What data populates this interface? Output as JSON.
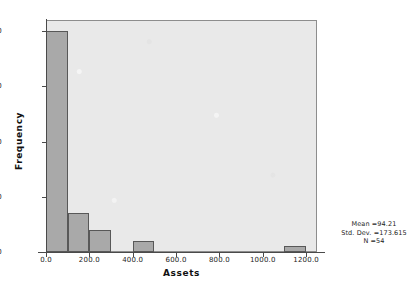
{
  "chart_data": {
    "type": "bar",
    "subtype": "histogram",
    "title": "",
    "xlabel": "Assets",
    "ylabel": "Frequency",
    "xlim": [
      0,
      1250
    ],
    "ylim": [
      0,
      42
    ],
    "xticks": [
      "0.0",
      "200.0",
      "400.0",
      "600.0",
      "800.0",
      "1000.0",
      "1200.0"
    ],
    "xtick_values": [
      0,
      200,
      400,
      600,
      800,
      1000,
      1200
    ],
    "yticks": [
      "0",
      "10",
      "20",
      "30",
      "40"
    ],
    "ytick_values": [
      0,
      10,
      20,
      30,
      40
    ],
    "grid": false,
    "legend": "none",
    "bin_width": 100,
    "bins": [
      {
        "x0": 0,
        "x1": 100,
        "value": 40
      },
      {
        "x0": 100,
        "x1": 200,
        "value": 7
      },
      {
        "x0": 200,
        "x1": 300,
        "value": 4
      },
      {
        "x0": 400,
        "x1": 500,
        "value": 2
      },
      {
        "x0": 1100,
        "x1": 1200,
        "value": 1
      }
    ],
    "annotations": {
      "mean": "Mean =94.21",
      "std_dev": "Std. Dev. =173.615",
      "n": "N =54"
    },
    "colors": {
      "bar_fill": "#a9a9a9",
      "bar_border": "#585858",
      "plot_background": "#e9e9e9",
      "page_background": "#ffffff",
      "axis": "#4a4a4a",
      "text": "#1c1c1c"
    }
  }
}
